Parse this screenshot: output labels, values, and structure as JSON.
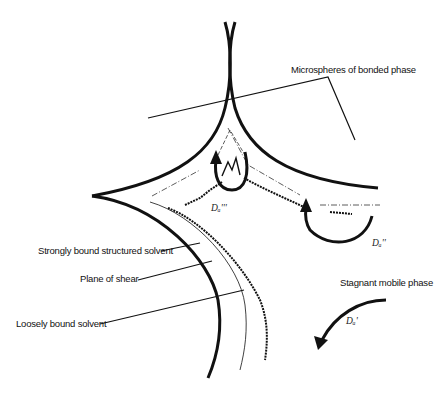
{
  "diagram": {
    "type": "schematic",
    "labels": {
      "microspheres": "Microspheres of bonded phase",
      "strongly_bound": "Strongly bound structured solvent",
      "plane_of_shear": "Plane of shear",
      "loosely_bound": "Loosely bound solvent",
      "stagnant": "Stagnant mobile phase"
    },
    "diffusion_labels": {
      "d1": "Dₐ'''",
      "d2": "Dₐ''",
      "d3": "Dₐ'"
    },
    "colors": {
      "stroke": "#111111",
      "background": "#ffffff"
    }
  }
}
